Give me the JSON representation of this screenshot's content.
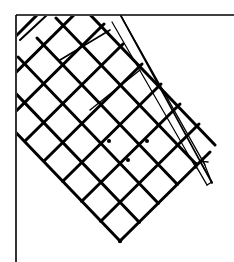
{
  "figure": {
    "type": "line-drawing",
    "stroke_color": "#000000",
    "background_color": "#ffffff",
    "border": {
      "top_y": 15,
      "left_x": 16
    },
    "grid": {
      "rows": 6,
      "cols": 6,
      "bottom_vertex": [
        120,
        241
      ],
      "angle_deg": 45
    },
    "rail": {
      "start": [
        120,
        16
      ],
      "end": [
        211,
        184
      ]
    }
  }
}
